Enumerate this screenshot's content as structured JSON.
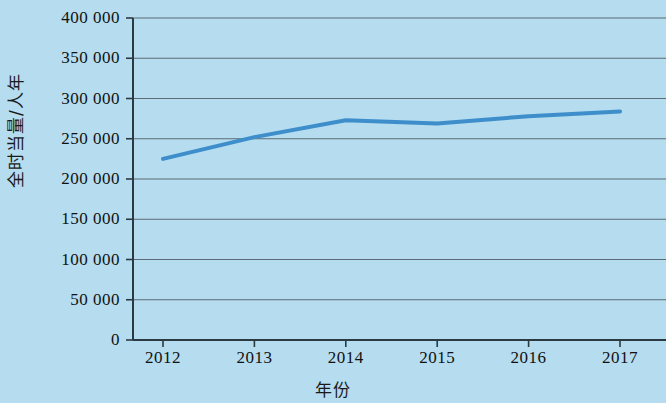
{
  "chart_data": {
    "type": "line",
    "title": "",
    "subtitle": "",
    "xlabel": "年份",
    "ylabel": "全时当量/人年",
    "categories": [
      "2012",
      "2013",
      "2014",
      "2015",
      "2016",
      "2017"
    ],
    "x": [
      2012,
      2013,
      2014,
      2015,
      2016,
      2017
    ],
    "series": [
      {
        "name": "全时当量",
        "values": [
          225000,
          252000,
          273000,
          269000,
          278000,
          284000
        ],
        "color": "#3d8ecb",
        "line_width": 4,
        "markers": false
      }
    ],
    "ylim": [
      0,
      400000
    ],
    "yticks": [
      0,
      50000,
      100000,
      150000,
      200000,
      250000,
      300000,
      350000,
      400000
    ],
    "ytick_labels": [
      "0",
      "50 000",
      "100 000",
      "150 000",
      "200 000",
      "250 000",
      "300 000",
      "350 000",
      "400 000"
    ],
    "xtick_labels": [
      "2012",
      "2013",
      "2014",
      "2015",
      "2016",
      "2017"
    ],
    "grid": true,
    "grid_axis": "y",
    "grid_color": "#5b6b77",
    "legend": false,
    "legend_position": "none",
    "background_color": "#b5dcef",
    "axis_color": "#2b3942",
    "annotations": []
  },
  "colors": {
    "background": "#b5dcef",
    "line": "#3d8ecb",
    "axis": "#2b3942",
    "grid": "#5b6b77",
    "text": "#111111"
  }
}
